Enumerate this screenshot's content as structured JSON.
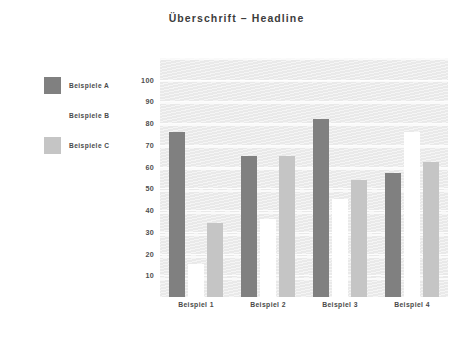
{
  "chart_data": {
    "type": "bar",
    "title": "Überschrift – Headline",
    "subtitle": "",
    "xlabel": "",
    "ylabel": "",
    "categories": [
      "Beispiel 1",
      "Beispiel 2",
      "Beispiel 3",
      "Beispiel 4"
    ],
    "series": [
      {
        "name": "Beispiele A",
        "color": "#808080",
        "values": [
          76,
          65,
          82,
          57
        ]
      },
      {
        "name": "Beispiele B",
        "color": "#ffffff",
        "values": [
          15,
          36,
          45,
          76
        ]
      },
      {
        "name": "Beispiele C",
        "color": "#c5c5c5",
        "values": [
          34,
          65,
          54,
          62
        ]
      }
    ],
    "ylim": [
      0,
      110
    ],
    "yticks": [
      10,
      20,
      30,
      40,
      50,
      60,
      70,
      80,
      90,
      100
    ],
    "ytick_labels": [
      "10",
      "20",
      "30",
      "40",
      "50",
      "60",
      "70",
      "80",
      "90",
      "100"
    ],
    "grid": true,
    "grid_orientation": "horizontal",
    "legend_position": "left-outside",
    "plot_background": "#e9e9e9",
    "figure_background": "#ffffff",
    "text_color": "#4a4a4a"
  },
  "legend": {
    "items": [
      {
        "label": "Beispiele A",
        "color": "#808080"
      },
      {
        "label": "Beispiele B",
        "color": "#ffffff"
      },
      {
        "label": "Beispiele C",
        "color": "#c5c5c5"
      }
    ]
  }
}
